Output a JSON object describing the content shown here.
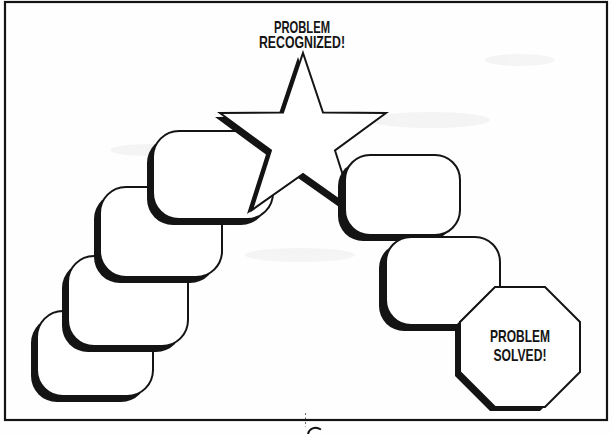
{
  "page": {
    "background_color": "#fefefe",
    "ink_color": "#141414",
    "shape_fill_color": "#ffffff"
  },
  "diagram": {
    "description_shapes": {
      "left_step_boxes_count": 4,
      "right_step_boxes_count": 2,
      "start_shape": "star",
      "end_shape": "octagon"
    },
    "start_label": {
      "line1": "PROBLEM",
      "line2": "RECOGNIZED!"
    },
    "end_label": {
      "line1": "PROBLEM",
      "line2": "SOLVED!"
    }
  }
}
